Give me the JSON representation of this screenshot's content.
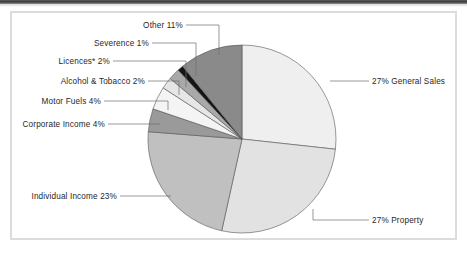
{
  "figure": {
    "background_color": "#ffffff",
    "frame_color": "#dcdcdc",
    "top_rule_color": "#3a3a3a"
  },
  "chart_data": {
    "type": "pie",
    "title": "",
    "subtitle": "",
    "xlabel": "",
    "ylabel": "",
    "legend_position": "none",
    "grid": false,
    "start_angle_deg": -90,
    "direction": "clockwise",
    "center": {
      "x": 242,
      "y": 139
    },
    "radius": 94,
    "categories": [
      "General Sales",
      "Property",
      "Individual Income",
      "Corporate Income",
      "Motor Fuels",
      "Alcohol & Tobacco",
      "Licences*",
      "Severence",
      "Other"
    ],
    "values": [
      27,
      27,
      23,
      4,
      4,
      2,
      2,
      1,
      11
    ],
    "units": "percent",
    "labels": [
      "27% General Sales",
      "27% Property",
      "Individual Income 23%",
      "Corporate Income 4%",
      "Motor Fuels 4%",
      "Alcohol & Tobacco 2%",
      "Licences* 2%",
      "Severence 1%",
      "Other 11%"
    ],
    "colors": [
      "#efefef",
      "#e2e2e2",
      "#c0c0c0",
      "#9a9a9a",
      "#f4f4f4",
      "#e6e6e6",
      "#a9a9a9",
      "#141414",
      "#8a8a8a"
    ],
    "slice_stroke": "#555555",
    "leader_line_color": "#6e6e6e",
    "label_color": "#272727"
  },
  "labels": {
    "general_sales": "27% General Sales",
    "property": "27% Property",
    "individual_income": "Individual Income 23%",
    "corporate_income": "Corporate Income 4%",
    "motor_fuels": "Motor Fuels 4%",
    "alcohol_tobacco": "Alcohol & Tobacco 2%",
    "licences": "Licences* 2%",
    "severence": "Severence 1%",
    "other": "Other 11%"
  }
}
